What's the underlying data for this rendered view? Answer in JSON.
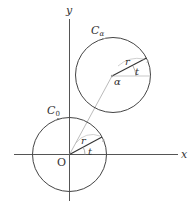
{
  "diagram": {
    "axes": {
      "x_label": "x",
      "y_label": "y",
      "origin_label": "O"
    },
    "circles": [
      {
        "name": "C0",
        "label_main": "C",
        "label_sub": "0",
        "center_label": "",
        "radius_label": "r",
        "angle_label": "t"
      },
      {
        "name": "C_alpha",
        "label_main": "C",
        "label_sub": "α",
        "center_label": "α",
        "radius_label": "r",
        "angle_label": "t"
      }
    ],
    "colors": {
      "stroke": "#333333",
      "light": "#aaaaaa"
    }
  }
}
